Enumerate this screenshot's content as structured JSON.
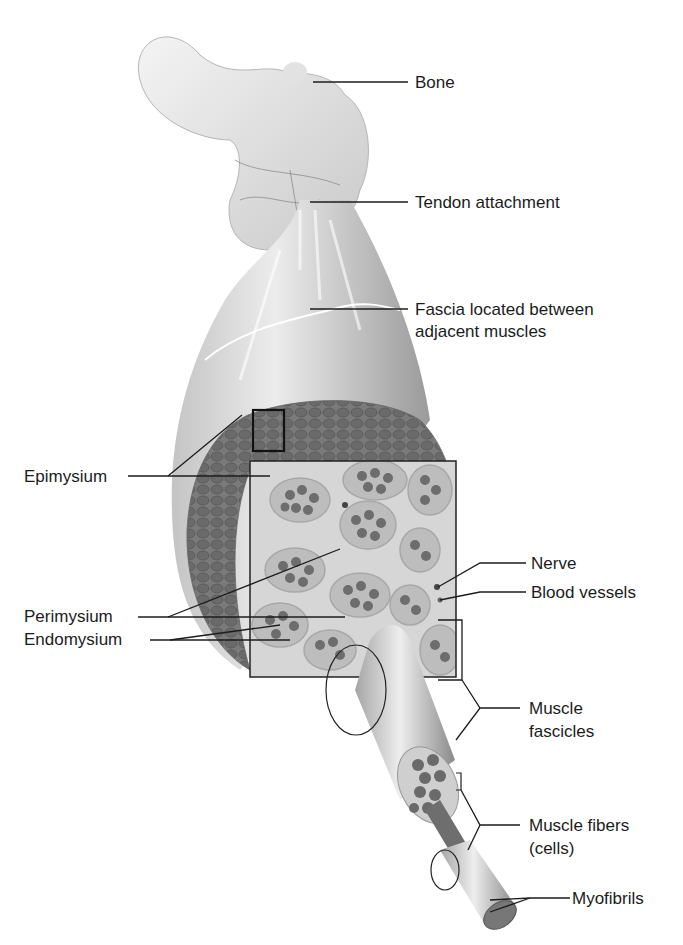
{
  "figure": {
    "background_color": "#ffffff",
    "ink_color": "#1c1c1c",
    "tissue_colors": {
      "bone": "#e6e6e6",
      "fascia": "#d0d0d0",
      "fascicle_bundle": "#6e6e6e",
      "connective_tissue": "#d8d8d8"
    }
  },
  "labels": {
    "bone": "Bone",
    "tendon": "Tendon attachment",
    "fascia_line1": "Fascia located between",
    "fascia_line2": "adjacent muscles",
    "epimysium": "Epimysium",
    "nerve": "Nerve",
    "blood_vessels": "Blood vessels",
    "perimysium": "Perimysium",
    "endomysium": "Endomysium",
    "fascicles_line1": "Muscle",
    "fascicles_line2": "fascicles",
    "fibers_line1": "Muscle fibers",
    "fibers_line2": "(cells)",
    "myofibrils": "Myofibrils"
  }
}
